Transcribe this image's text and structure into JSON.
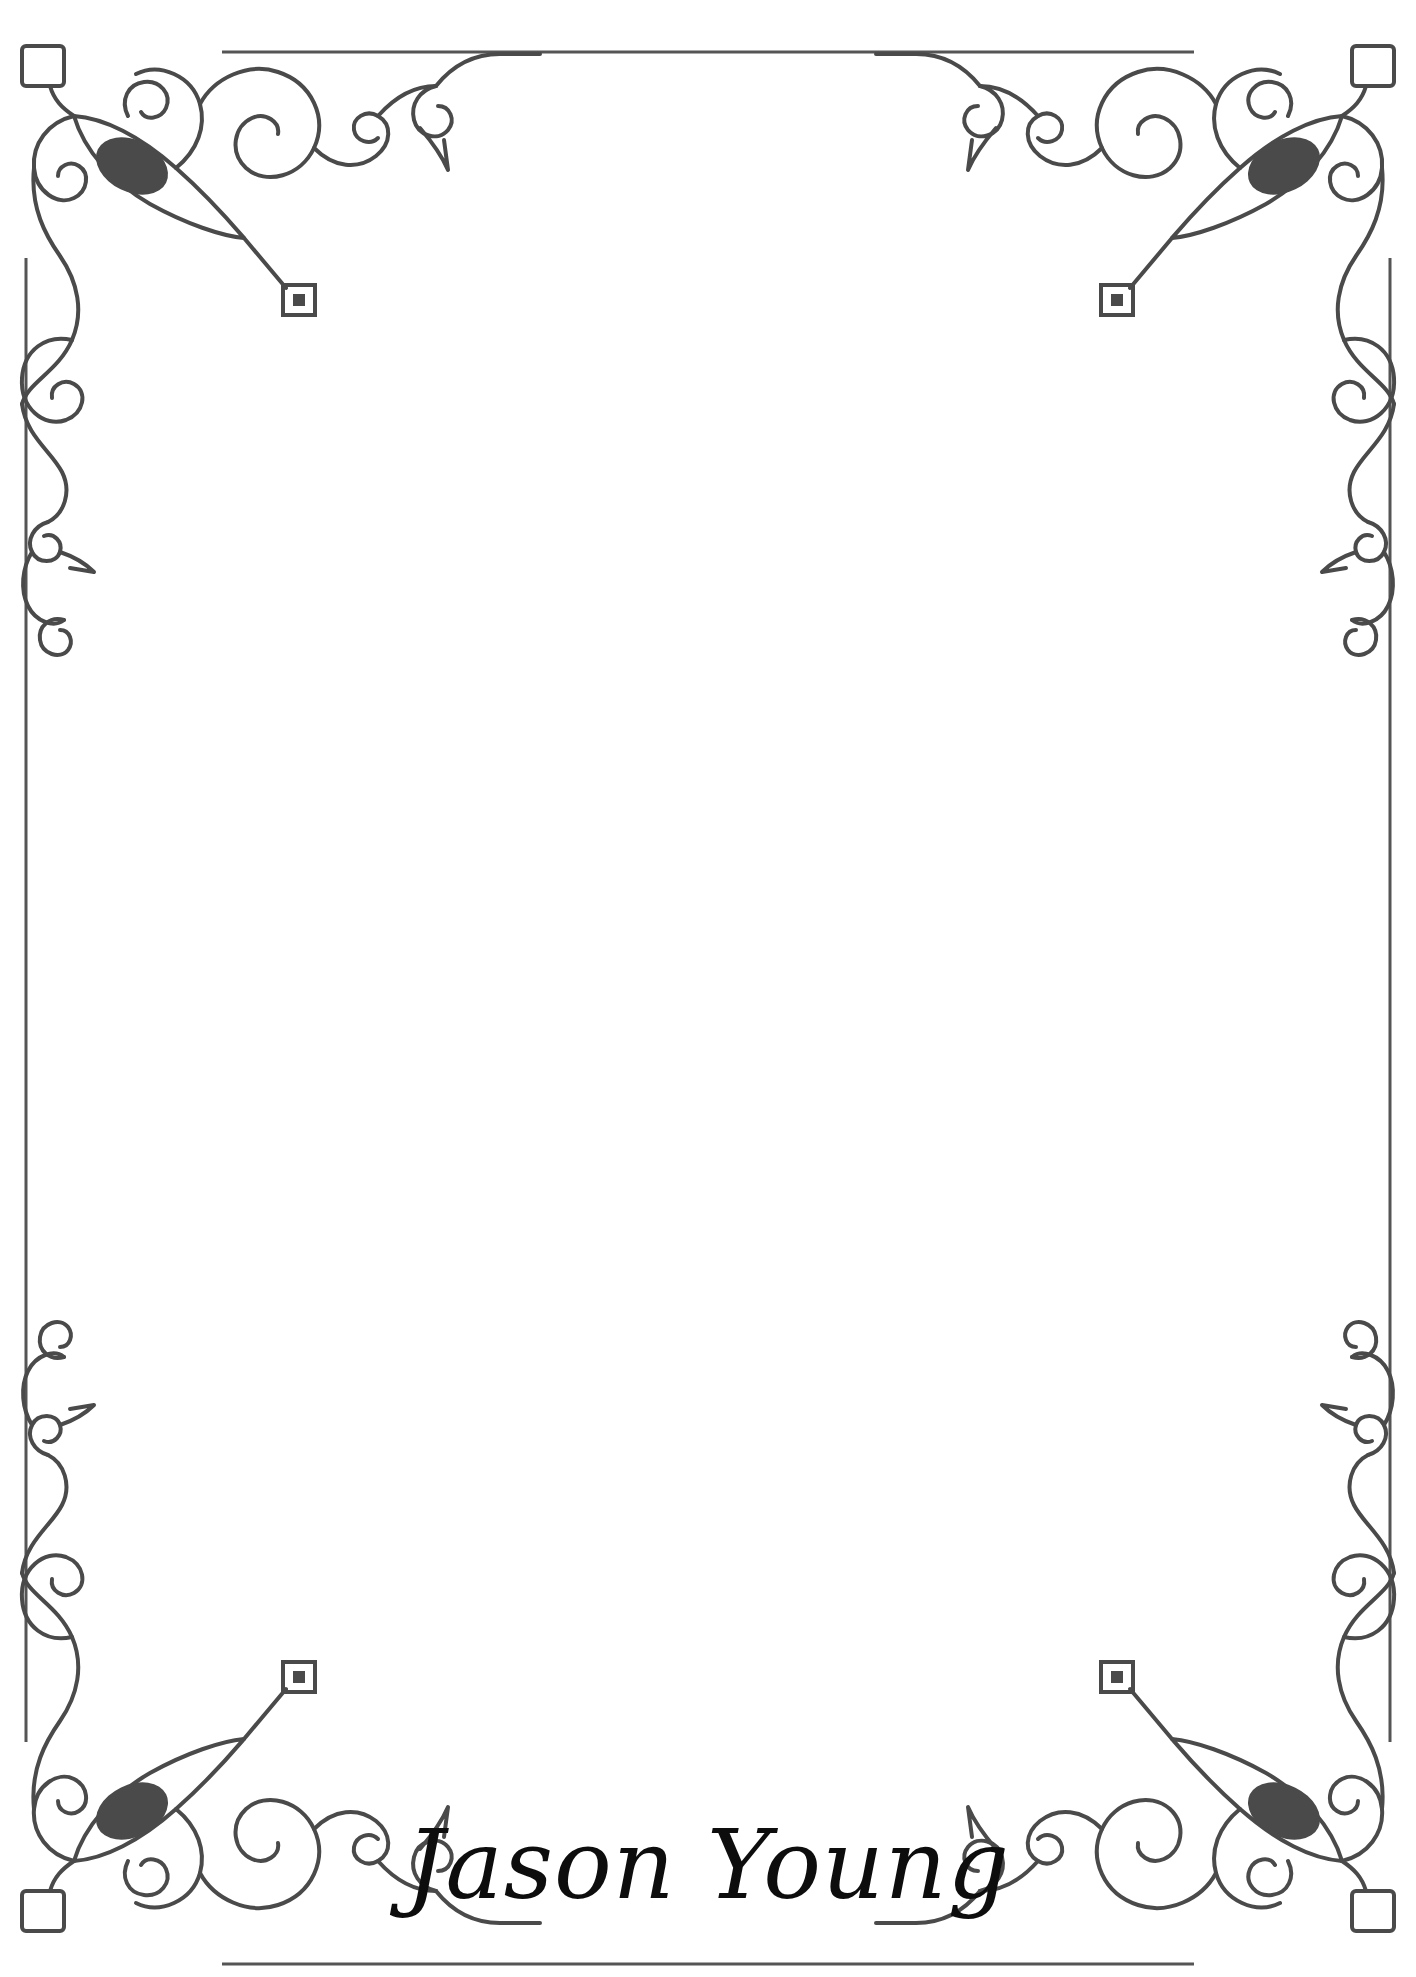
{
  "page": {
    "background_color": "#ffffff",
    "width": 1416,
    "height": 1977,
    "orientation": "portrait"
  },
  "border": {
    "name": "decorative-frame",
    "line_color": "#555555",
    "line_width": 3,
    "inset_left": 26,
    "inset_top": 52,
    "inset_right": 1390,
    "inset_bottom": 1964,
    "corner_radius": 28
  },
  "ornaments": {
    "stroke_color": "#4a4a4a",
    "fill_color": "#4a4a4a",
    "accent_color": "#4f4f4f",
    "count": 4,
    "items": [
      {
        "name": "corner-ornament-top-left",
        "position": "top-left"
      },
      {
        "name": "corner-ornament-top-right",
        "position": "top-right"
      },
      {
        "name": "corner-ornament-bottom-left",
        "position": "bottom-left"
      },
      {
        "name": "corner-ornament-bottom-right",
        "position": "bottom-right"
      }
    ],
    "motifs": [
      "scroll-spiral",
      "teardrop-leaf",
      "open-square",
      "concentric-square",
      "small-curl"
    ]
  },
  "signature": {
    "text": "Jason Young",
    "color": "#0d0d0d",
    "font_size": 96,
    "center_x": 708,
    "baseline_y": 1898,
    "style": "script-calligraphy"
  },
  "content": {
    "body_text": "",
    "note": ""
  }
}
